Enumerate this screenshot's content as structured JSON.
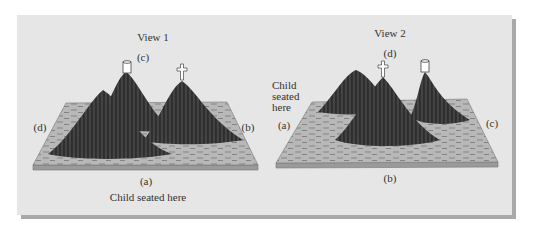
{
  "figure": {
    "view1": {
      "title": "View 1",
      "labels": {
        "top": "(c)",
        "left": "(d)",
        "right": "(b)",
        "bottom": "(a)"
      },
      "caption": "Child seated here",
      "objects": [
        {
          "type": "house-cylinder",
          "on": "back-center mountain"
        },
        {
          "type": "cross",
          "on": "right mountain"
        }
      ]
    },
    "view2": {
      "title": "View 2",
      "labels": {
        "top": "(d)",
        "left": "(a)",
        "right": "(c)",
        "bottom": "(b)"
      },
      "caption": "Child seated here",
      "objects": [
        {
          "type": "cross",
          "on": "front-center mountain"
        },
        {
          "type": "house-cylinder",
          "on": "right mountain"
        }
      ]
    },
    "colors": {
      "panel": "#e6e6e6",
      "shadow": "#a9a9a9",
      "board_top": "#b9b9b9",
      "board_edge": "#8c8c8c",
      "mountain": "#3a3a3a",
      "mountain_dark": "#262626"
    }
  }
}
